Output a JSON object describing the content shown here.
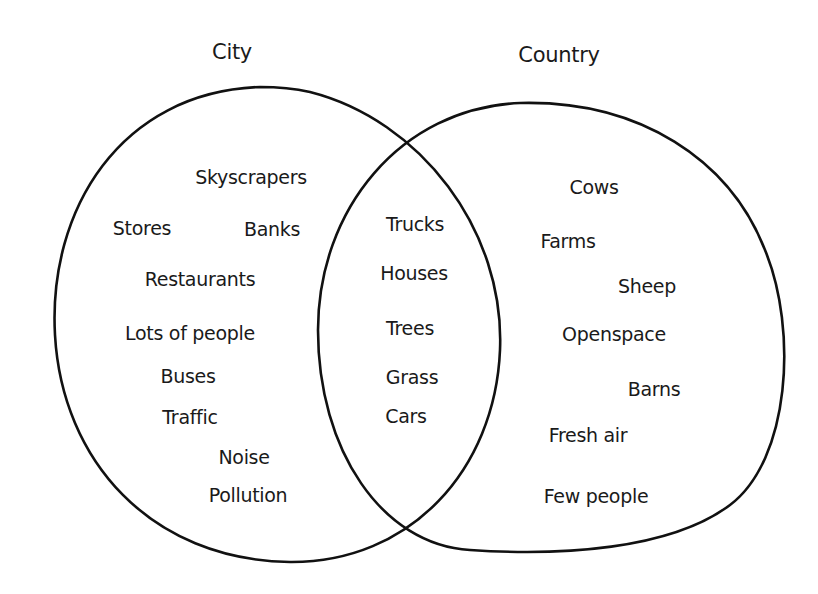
{
  "diagram": {
    "type": "venn",
    "sets": [
      {
        "name": "City",
        "title_pos": [
          232,
          52
        ],
        "items": [
          {
            "text": "Skyscrapers",
            "pos": [
              251,
              177
            ]
          },
          {
            "text": "Stores",
            "pos": [
              142,
              228
            ]
          },
          {
            "text": "Banks",
            "pos": [
              272,
              229
            ]
          },
          {
            "text": "Restaurants",
            "pos": [
              200,
              279
            ]
          },
          {
            "text": "Lots of people",
            "pos": [
              190,
              333
            ]
          },
          {
            "text": "Buses",
            "pos": [
              188,
              376
            ]
          },
          {
            "text": "Traffic",
            "pos": [
              190,
              417
            ]
          },
          {
            "text": "Noise",
            "pos": [
              244,
              457
            ]
          },
          {
            "text": "Pollution",
            "pos": [
              248,
              495
            ]
          }
        ]
      },
      {
        "name": "Country",
        "title_pos": [
          559,
          55
        ],
        "items": [
          {
            "text": "Cows",
            "pos": [
              594,
              187
            ]
          },
          {
            "text": "Farms",
            "pos": [
              568,
              241
            ]
          },
          {
            "text": "Sheep",
            "pos": [
              647,
              286
            ]
          },
          {
            "text": "Openspace",
            "pos": [
              614,
              334
            ]
          },
          {
            "text": "Barns",
            "pos": [
              654,
              389
            ]
          },
          {
            "text": "Fresh air",
            "pos": [
              588,
              435
            ]
          },
          {
            "text": "Few people",
            "pos": [
              596,
              496
            ]
          }
        ]
      }
    ],
    "intersection": {
      "label": "Both",
      "items": [
        {
          "text": "Trucks",
          "pos": [
            415,
            224
          ]
        },
        {
          "text": "Houses",
          "pos": [
            414,
            273
          ]
        },
        {
          "text": "Trees",
          "pos": [
            410,
            328
          ]
        },
        {
          "text": "Grass",
          "pos": [
            412,
            377
          ]
        },
        {
          "text": "Cars",
          "pos": [
            406,
            416
          ]
        }
      ]
    },
    "stroke_color": "#111111",
    "background": "#ffffff"
  }
}
